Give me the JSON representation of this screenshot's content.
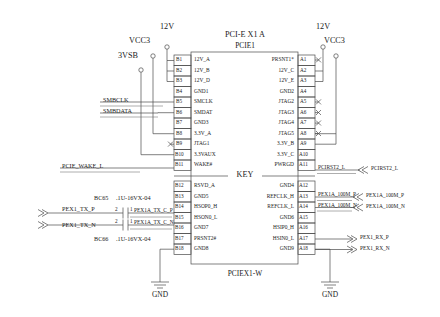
{
  "title": {
    "main": "PCI-E X1 A",
    "sub": "PCIE1",
    "footer": "PCIEX1-W"
  },
  "power_rails": [
    {
      "name": "12V",
      "id": "rail-12v-left"
    },
    {
      "name": "VCC3",
      "id": "rail-vcc3-left"
    },
    {
      "name": "3VSB",
      "id": "rail-3vsb"
    },
    {
      "name": "12V",
      "id": "rail-12v-right"
    },
    {
      "name": "VCC3",
      "id": "rail-vcc3-right"
    }
  ],
  "key_label": "KEY",
  "ground_labels": [
    "GND",
    "GND"
  ],
  "left_pins": [
    {
      "num": "B1",
      "name": "12V_A"
    },
    {
      "num": "B2",
      "name": "12V_B"
    },
    {
      "num": "B3",
      "name": "12V_D"
    },
    {
      "num": "B4",
      "name": "GND1"
    },
    {
      "num": "B5",
      "name": "SMCLK"
    },
    {
      "num": "B6",
      "name": "SMDAT"
    },
    {
      "num": "B7",
      "name": "GND3"
    },
    {
      "num": "B8",
      "name": "3.3V_A"
    },
    {
      "num": "B9",
      "name": "JTAG1"
    },
    {
      "num": "B10",
      "name": "3.3VAUX"
    },
    {
      "num": "B11",
      "name": "WAKE#"
    },
    {
      "num": "B12",
      "name": "RSVD_A"
    },
    {
      "num": "B13",
      "name": "GND5"
    },
    {
      "num": "B14",
      "name": "HSOP0_H"
    },
    {
      "num": "B15",
      "name": "HSON0_L"
    },
    {
      "num": "B16",
      "name": "GND7"
    },
    {
      "num": "B17",
      "name": "PRSNT2#"
    },
    {
      "num": "B18",
      "name": "GND8"
    }
  ],
  "right_pins": [
    {
      "num": "A1",
      "name": "PRSNT1*"
    },
    {
      "num": "A2",
      "name": "12V_C"
    },
    {
      "num": "A3",
      "name": "12V_E"
    },
    {
      "num": "A4",
      "name": "GND2"
    },
    {
      "num": "A5",
      "name": "JTAG2"
    },
    {
      "num": "A6",
      "name": "JTAG3"
    },
    {
      "num": "A7",
      "name": "JTAG4"
    },
    {
      "num": "A8",
      "name": "JTAG5"
    },
    {
      "num": "A9",
      "name": "3.3V_B"
    },
    {
      "num": "A10",
      "name": "3.3V_C"
    },
    {
      "num": "A11",
      "name": "PWRGD"
    },
    {
      "num": "A12",
      "name": "GND4"
    },
    {
      "num": "A13",
      "name": "REFCLK_H"
    },
    {
      "num": "A14",
      "name": "REFCLK_L"
    },
    {
      "num": "A15",
      "name": "GND6"
    },
    {
      "num": "A16",
      "name": "HSIP0_H"
    },
    {
      "num": "A17",
      "name": "HSIN0_L"
    },
    {
      "num": "A18",
      "name": "GND9"
    }
  ],
  "left_nets": [
    {
      "label": "SMBCLK",
      "pin": "B5"
    },
    {
      "label": "SMBDATA",
      "pin": "B6"
    },
    {
      "label": "PCIE_WAKE_L",
      "pin": "B11"
    }
  ],
  "capacitors": [
    {
      "ref": "BC65",
      "value": ".1U-16VX-04",
      "pin_left": "2",
      "pin_right": "1",
      "net_in": "PEX1_TX_P",
      "net_out": "PEX1A_TX_C_P",
      "pin": "B14"
    },
    {
      "ref": "BC66",
      "value": ".1U-16VX-04",
      "pin_left": "2",
      "pin_right": "1",
      "net_in": "PEX1_TX_N",
      "net_out": "PEX1A_TX_C_N",
      "pin": "B15"
    }
  ],
  "right_nets": [
    {
      "inner": "PCIRST2_L",
      "outer": "PCIRST2_L",
      "pin": "A11",
      "arrow": "in"
    },
    {
      "inner": "PEX1A_100M_P",
      "outer": "PEX1A_100M_P",
      "pin": "A13",
      "arrow": "in"
    },
    {
      "inner": "PEX1A_100M_N",
      "outer": "PEX1A_100M_N",
      "pin": "A14",
      "arrow": "in"
    },
    {
      "inner": "",
      "outer": "PEX1_RX_P",
      "pin": "A16",
      "arrow": "out"
    },
    {
      "inner": "",
      "outer": "PEX1_RX_N",
      "pin": "A17",
      "arrow": "out"
    }
  ],
  "no_connect_pins": [
    "A1",
    "A2",
    "A3",
    "A5",
    "A6",
    "A7",
    "A8",
    "B9"
  ]
}
